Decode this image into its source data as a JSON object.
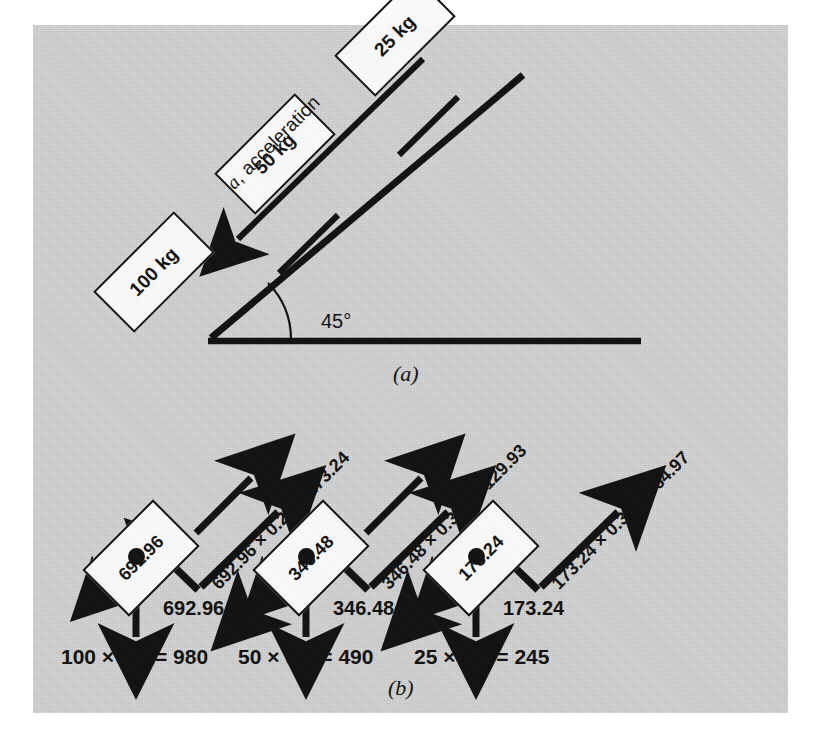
{
  "figure": {
    "panel_a": {
      "caption": "(a)",
      "incline_angle": "45°",
      "acceleration_label": "a, acceleration",
      "blocks": [
        {
          "mass_label": "100 kg"
        },
        {
          "mass_label": "50 kg"
        },
        {
          "mass_label": "25 kg"
        }
      ]
    },
    "panel_b": {
      "caption": "(b)",
      "bodies": [
        {
          "block_label": "692.96",
          "up_force_label": "T",
          "down_left_force_label": "",
          "normal_label": "692.96",
          "friction_expression": "692.96 × 0.25 = 173.24",
          "weight_expression": "100 × 9.8 = 980"
        },
        {
          "block_label": "346.48",
          "up_force_label": "R",
          "down_left_force_label": "T",
          "normal_label": "346.48",
          "friction_expression": "346.48 × 0.375 = 129.93",
          "weight_expression": "50 × 9.8 = 490"
        },
        {
          "block_label": "173.24",
          "up_force_label": "",
          "down_left_force_label": "R",
          "normal_label": "173.24",
          "friction_expression": "173.24 × 0.375 = 64.97",
          "weight_expression": "25 × 9.8 = 245"
        }
      ]
    }
  },
  "colors": {
    "panel_background": "#d4d4d4",
    "page_background": "#ffffff",
    "ink": "#111111",
    "block_fill": "#fafafa"
  }
}
